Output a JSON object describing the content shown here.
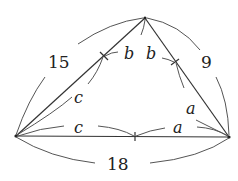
{
  "diagram": {
    "type": "triangle-incircle-tangent-lengths",
    "sides": [
      {
        "name": "left",
        "length_label": "15"
      },
      {
        "name": "right",
        "length_label": "9"
      },
      {
        "name": "base",
        "length_label": "18"
      }
    ],
    "tangent_segment_labels": {
      "left_upper": "b",
      "left_lower": "c",
      "right_upper": "b",
      "right_lower": "a",
      "base_left": "c",
      "base_right": "a"
    }
  }
}
